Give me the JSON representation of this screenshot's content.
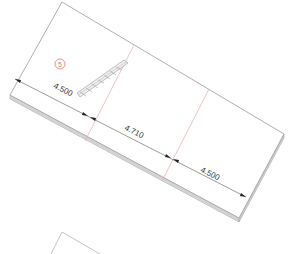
{
  "view": {
    "type": "sheet-metal-flat-pattern-drawing",
    "background": "#ffffff"
  },
  "part": {
    "outline_color": "#9a9a9a",
    "edge_color": "#bdbdbd",
    "fold_line_color": "#e8a9a9"
  },
  "balloon": {
    "label": "5",
    "color": "#e07a6a"
  },
  "dimensions": [
    {
      "label": "4.500",
      "segment": "left"
    },
    {
      "label": "4.710",
      "segment": "middle"
    },
    {
      "label": "4.500",
      "segment": "right"
    }
  ],
  "hatch_label": "cross-section-hatch"
}
